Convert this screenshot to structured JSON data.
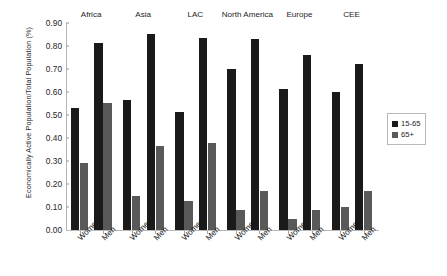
{
  "chart_data": {
    "type": "bar",
    "title": "",
    "xlabel": "",
    "ylabel": "Economically Active Population/Total Population (%)",
    "ylim": [
      0.0,
      0.9
    ],
    "ytick_labels": [
      "0.90",
      "0.80",
      "0.70",
      "0.60",
      "0.50",
      "0.40",
      "0.30",
      "0.20",
      "0.10",
      "0.00"
    ],
    "ytick_values": [
      0.9,
      0.8,
      0.7,
      0.6,
      0.5,
      0.4,
      0.3,
      0.2,
      0.1,
      0.0
    ],
    "grid": false,
    "legend_position": "right",
    "groups": [
      "Africa",
      "Asia",
      "LAC",
      "North America",
      "Europe",
      "CEE"
    ],
    "categories": [
      "Africa Women",
      "Africa Men",
      "Asia Women",
      "Asia Men",
      "LAC Women",
      "LAC Men",
      "North America Women",
      "North America Men",
      "Europe Women",
      "Europe Men",
      "CEE Women",
      "CEE Men"
    ],
    "subcategories": [
      "Women",
      "Men"
    ],
    "series": [
      {
        "name": "15-65",
        "color": "#1a1a1a",
        "values": [
          0.532,
          0.815,
          0.565,
          0.851,
          0.515,
          0.836,
          0.701,
          0.829,
          0.611,
          0.76,
          0.598,
          0.721
        ]
      },
      {
        "name": "65+",
        "color": "#595959",
        "values": [
          0.292,
          0.552,
          0.148,
          0.366,
          0.127,
          0.377,
          0.088,
          0.17,
          0.046,
          0.089,
          0.102,
          0.171
        ]
      }
    ]
  },
  "legend": {
    "entries": [
      {
        "label": "15-65",
        "color": "#1a1a1a"
      },
      {
        "label": "65+",
        "color": "#595959"
      }
    ]
  }
}
